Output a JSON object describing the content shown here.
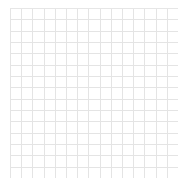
{
  "canvas": {
    "name": "grid-pattern-canvas",
    "width": 191,
    "height": 187,
    "background_color": "#ffffff"
  },
  "grid": {
    "label": "graph-paper-grid",
    "origin_x": 10,
    "origin_y": 8,
    "plate_width": 168,
    "plate_height": 170,
    "columns": 15,
    "rows": 15,
    "cell_width": 11.2,
    "cell_height": 11.33,
    "minor_line_color": "#d6d6d6",
    "minor_line_style": "dotted",
    "minor_line_width": 1,
    "major_line_color": "#e4e4e4",
    "major_line_style": "solid",
    "major_line_width": 1,
    "major_interval": 1,
    "dot_period": 2,
    "dot_length": 1
  },
  "chart_data": {
    "type": "table",
    "title": "",
    "subtitle": "",
    "xlabel": "",
    "ylabel": "",
    "grid": true,
    "legend": "none",
    "annotations": [],
    "categories": [],
    "values": []
  }
}
